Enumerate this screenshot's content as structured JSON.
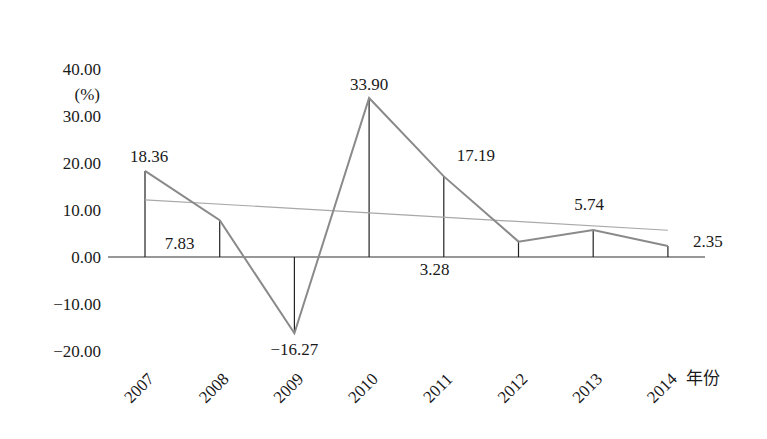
{
  "chart_data": {
    "type": "line",
    "title": "",
    "xlabel": "年份",
    "ylabel": "(%)",
    "categories": [
      "2007",
      "2008",
      "2009",
      "2010",
      "2011",
      "2012",
      "2013",
      "2014"
    ],
    "series": [
      {
        "name": "growth rate",
        "values": [
          18.36,
          7.83,
          -16.27,
          33.9,
          17.19,
          3.28,
          5.74,
          2.35
        ],
        "labels": [
          "18.36",
          "7.83",
          "−16.27",
          "33.90",
          "17.19",
          "3.28",
          "5.74",
          "2.35"
        ],
        "color": "#8a8a8a"
      },
      {
        "name": "linear trend",
        "start": 12.2,
        "end": 5.7,
        "color": "#a8a8a8"
      }
    ],
    "ylim": [
      -20,
      40
    ],
    "yticks": [
      40,
      30,
      20,
      10,
      0,
      -10,
      -20
    ],
    "ytick_labels": [
      "40.00",
      "30.00",
      "20.00",
      "10.00",
      "0.00",
      "−10.00",
      "−20.00"
    ],
    "grid": false,
    "legend": "none",
    "drop_lines": true
  }
}
